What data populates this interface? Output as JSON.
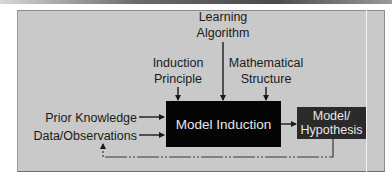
{
  "diagram": {
    "inputs_top": [
      {
        "id": "learning-algorithm",
        "line1": "Learning",
        "line2": "Algorithm"
      },
      {
        "id": "induction-principle",
        "line1": "Induction",
        "line2": "Principle"
      },
      {
        "id": "mathematical-structure",
        "line1": "Mathematical",
        "line2": "Structure"
      }
    ],
    "inputs_left": [
      {
        "id": "prior-knowledge",
        "label": "Prior Knowledge"
      },
      {
        "id": "data-observations",
        "label": "Data/Observations"
      }
    ],
    "process": {
      "label": "Model Induction"
    },
    "output": {
      "line1": "Model/",
      "line2": "Hypothesis"
    },
    "feedback": {
      "from": "Model/Hypothesis",
      "to": "Data/Observations",
      "style": "dotted-segments"
    },
    "colors": {
      "panel": "#c9c9c9",
      "process_box": "#050505",
      "output_box": "#2a2a2a",
      "text": "#1a1a1a",
      "box_text": "#e8e8e8"
    }
  }
}
